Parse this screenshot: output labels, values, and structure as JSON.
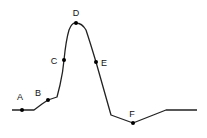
{
  "diagram": {
    "type": "action-potential-curve",
    "line_color": "#222222",
    "point_color": "#111111",
    "points": [
      {
        "id": "A",
        "label": "A",
        "x": 22,
        "y": 110,
        "lx": 20,
        "ly": 100
      },
      {
        "id": "B",
        "label": "B",
        "x": 48,
        "y": 100,
        "lx": 38,
        "ly": 96
      },
      {
        "id": "C",
        "label": "C",
        "x": 64,
        "y": 60,
        "lx": 54,
        "ly": 64
      },
      {
        "id": "D",
        "label": "D",
        "x": 76,
        "y": 23,
        "lx": 76,
        "ly": 16
      },
      {
        "id": "E",
        "label": "E",
        "x": 96,
        "y": 62,
        "lx": 104,
        "ly": 66
      },
      {
        "id": "F",
        "label": "F",
        "x": 133,
        "y": 123,
        "lx": 132,
        "ly": 117
      }
    ]
  }
}
